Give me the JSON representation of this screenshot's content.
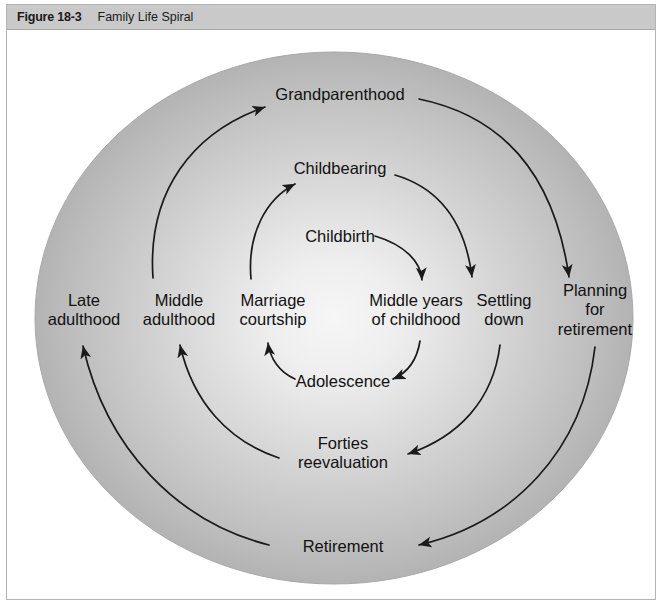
{
  "figure": {
    "number": "Figure 18-3",
    "title": "Family Life Spiral"
  },
  "diagram": {
    "type": "spiral-cycle",
    "background_color": "#ffffff",
    "circle_fill_outer": "#b9b9b9",
    "circle_fill_inner": "#f2f2f2",
    "arrow_color": "#1a1a1a",
    "stages": [
      {
        "id": "grandparenthood",
        "label": "Grandparenthood",
        "x": 333,
        "y": 64,
        "ring": 4,
        "side": "top"
      },
      {
        "id": "childbearing",
        "label": "Childbearing",
        "x": 333,
        "y": 138,
        "ring": 3,
        "side": "top"
      },
      {
        "id": "childbirth",
        "label": "Childbirth",
        "x": 333,
        "y": 206,
        "ring": 2,
        "side": "top"
      },
      {
        "id": "late-adulthood",
        "label": "Late\nadulthood",
        "x": 77,
        "y": 279,
        "ring": 4,
        "side": "left"
      },
      {
        "id": "middle-adulthood",
        "label": "Middle\nadulthood",
        "x": 172,
        "y": 279,
        "ring": 3,
        "side": "left"
      },
      {
        "id": "marriage-courtship",
        "label": "Marriage\ncourtship",
        "x": 266,
        "y": 279,
        "ring": 2,
        "side": "left"
      },
      {
        "id": "middle-years-childhood",
        "label": "Middle years\nof childhood",
        "x": 409,
        "y": 279,
        "ring": 2,
        "side": "right"
      },
      {
        "id": "settling-down",
        "label": "Settling\ndown",
        "x": 497,
        "y": 279,
        "ring": 3,
        "side": "right"
      },
      {
        "id": "planning-retirement",
        "label": "Planning for\nretirement",
        "x": 588,
        "y": 279,
        "ring": 4,
        "side": "right"
      },
      {
        "id": "adolescence",
        "label": "Adolescence",
        "x": 336,
        "y": 351,
        "ring": 2,
        "side": "bottom"
      },
      {
        "id": "forties-reevaluation",
        "label": "Forties\nreevaluation",
        "x": 336,
        "y": 422,
        "ring": 3,
        "side": "bottom"
      },
      {
        "id": "retirement",
        "label": "Retirement",
        "x": 336,
        "y": 516,
        "ring": 4,
        "side": "bottom"
      }
    ],
    "transitions": [
      {
        "from": "childbirth",
        "to": "middle-years-childhood"
      },
      {
        "from": "middle-years-childhood",
        "to": "adolescence"
      },
      {
        "from": "adolescence",
        "to": "marriage-courtship"
      },
      {
        "from": "marriage-courtship",
        "to": "childbearing"
      },
      {
        "from": "childbearing",
        "to": "settling-down"
      },
      {
        "from": "settling-down",
        "to": "forties-reevaluation"
      },
      {
        "from": "forties-reevaluation",
        "to": "middle-adulthood"
      },
      {
        "from": "middle-adulthood",
        "to": "grandparenthood"
      },
      {
        "from": "grandparenthood",
        "to": "planning-retirement"
      },
      {
        "from": "planning-retirement",
        "to": "retirement"
      },
      {
        "from": "retirement",
        "to": "late-adulthood"
      }
    ]
  }
}
